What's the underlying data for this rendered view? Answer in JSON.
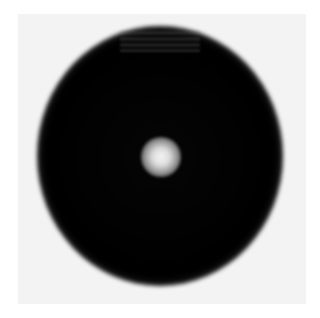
{
  "image": {
    "description": "Grayscale image of a dark circular disc with a small bright central spot, surrounded by a soft gray gradient halo on a light background",
    "colors": {
      "background": "#ffffff",
      "panel": "#f3f3f3",
      "disc": "#000000",
      "center_spot": "#f4f4f4",
      "halo_mid": "#9a9a9a"
    },
    "shapes": {
      "disc_center": [
        160,
        157
      ],
      "disc_radius_px": 100,
      "center_spot_radius_px": 18
    }
  }
}
